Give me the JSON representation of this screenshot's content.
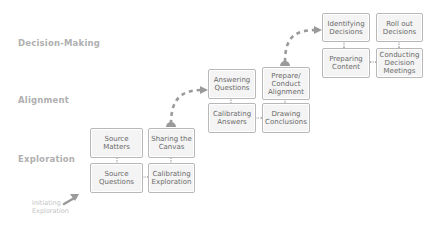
{
  "stages": {
    "decision_making": "Decision-Making",
    "alignment": "Alignment",
    "exploration": "Exploration"
  },
  "start": {
    "label": "Initiating\nExploration"
  },
  "exploration": {
    "source_matters": "Source Matters",
    "sharing_canvas": "Sharing the Canvas",
    "source_questions": "Source Questions",
    "calibrating_exploration": "Calibrating Exploration"
  },
  "alignment": {
    "answering_questions": "Answering Questions",
    "prepare_conduct": "Prepare/ Conduct Alignment",
    "calibrating_answers": "Calibrating Answers",
    "drawing_conclusions": "Drawing Conclusions"
  },
  "decision": {
    "identifying_decisions": "Identifying Decisions",
    "roll_out": "Roll out Decisions",
    "preparing_content": "Preparing Content",
    "conducting_meetings": "Conducting Decision Meetings"
  },
  "colors": {
    "label": "#b0b0b0",
    "box_border": "#b8b8b8",
    "box_fill": "#f4f4f4",
    "box_text": "#6a6a6a",
    "arrow": "#999999",
    "connector": "#a8a8a8"
  }
}
